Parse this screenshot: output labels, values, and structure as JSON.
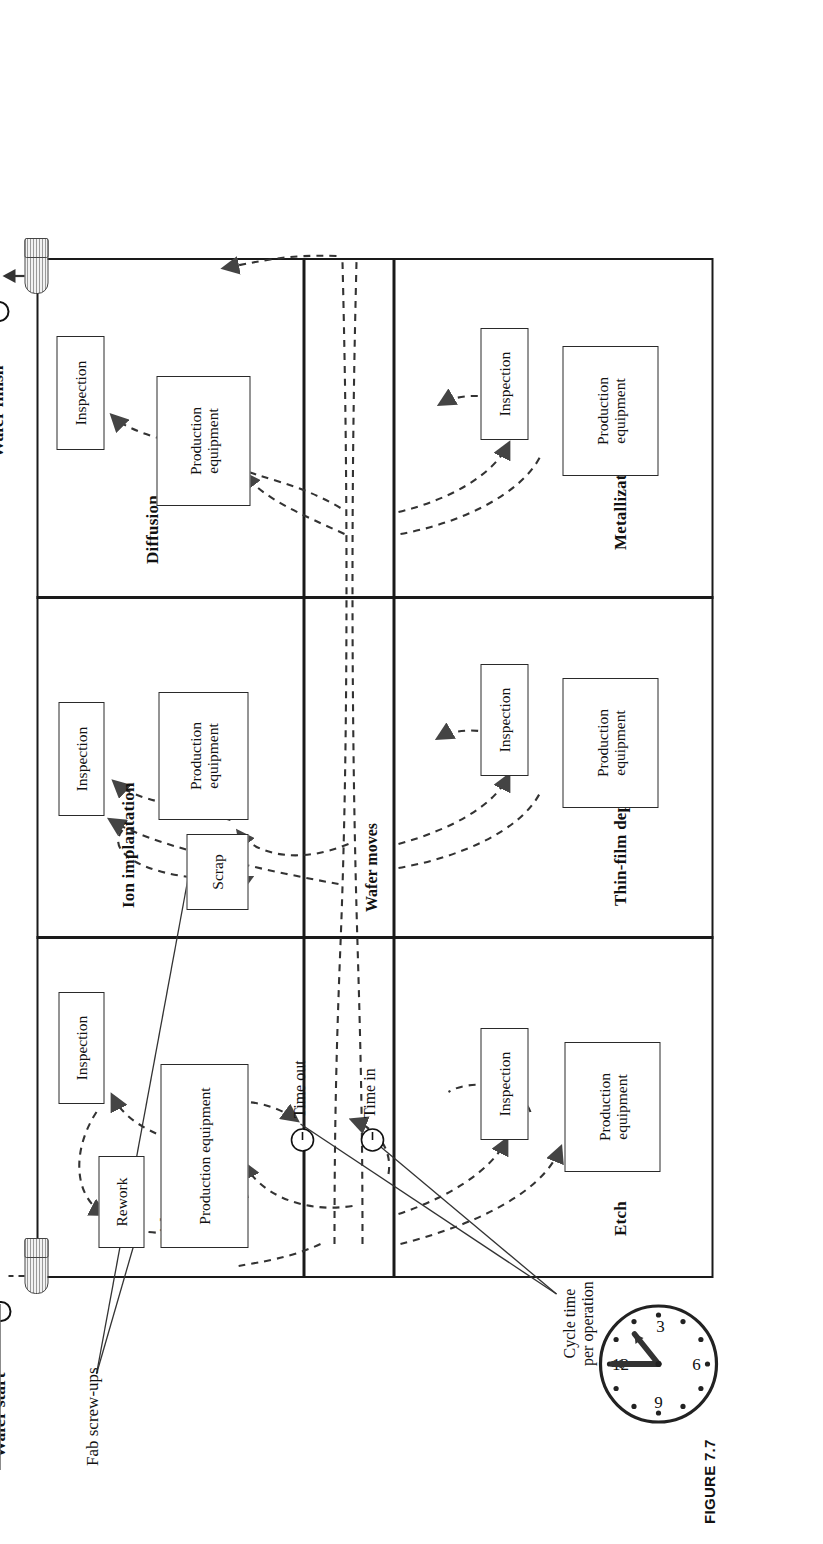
{
  "figure": {
    "caption": "FIGURE 7.7"
  },
  "endpoints": {
    "start_label": "Wafer start",
    "finish_label": "Wafer finish"
  },
  "corridor": {
    "wafer_moves_label": "Wafer moves"
  },
  "annotations": {
    "fab_screwups": "Fab screw-ups",
    "cycle_time": "Cycle time\nper operation",
    "cycle_time_line1": "Cycle time",
    "cycle_time_line2": "per operation",
    "time_in": "Time in",
    "time_out": "Time out"
  },
  "bays": [
    {
      "id": "lith",
      "label": "Lith",
      "boxes": [
        "Rework",
        "Inspection",
        "Production equipment"
      ]
    },
    {
      "id": "ion-implantation",
      "label": "Ion implantation",
      "boxes": [
        "Scrap",
        "Inspection",
        "Production equipment"
      ]
    },
    {
      "id": "diffusion",
      "label": "Diffusion",
      "boxes": [
        "Inspection",
        "Production equipment"
      ]
    },
    {
      "id": "etch",
      "label": "Etch",
      "boxes": [
        "Inspection",
        "Production equipment"
      ]
    },
    {
      "id": "thin-film-deposition",
      "label": "Thin-film deposition",
      "boxes": [
        "Inspection",
        "Production equipment"
      ]
    },
    {
      "id": "metallization",
      "label": "Metallization",
      "boxes": [
        "Inspection",
        "Production equipment"
      ]
    }
  ],
  "box_labels": {
    "inspection": "Inspection",
    "production_equipment_line1": "Production",
    "production_equipment_line2": "equipment",
    "production_equipment_inline": "Production equipment",
    "rework": "Rework",
    "scrap": "Scrap"
  },
  "calendars": {
    "start": {
      "name": "wafer-start-calendar",
      "highlighted_day": "1",
      "rows": [
        [
          "",
          "1",
          "2",
          "3",
          "4",
          "",
          ""
        ],
        [
          "",
          "6",
          "7",
          "8",
          "9",
          "10",
          "11"
        ],
        [
          "",
          "13",
          "14",
          "15",
          "16",
          "17",
          "18"
        ],
        [
          "",
          "20",
          "21",
          "22",
          "23",
          "24",
          "25"
        ],
        [
          "",
          "27",
          "28",
          "29",
          "30",
          "31",
          ""
        ]
      ]
    },
    "finish": {
      "name": "wafer-finish-calendar",
      "highlighted_day": "26",
      "rows": [
        [
          "",
          "",
          "",
          "",
          "",
          "",
          "1"
        ],
        [
          "2",
          "3",
          "4",
          "5",
          "6",
          "7",
          "8"
        ],
        [
          "9",
          "10",
          "11",
          "12",
          "13",
          "14",
          "15"
        ],
        [
          "16",
          "17",
          "18",
          "19",
          "20",
          "21",
          "22"
        ],
        [
          "23",
          "24",
          "25",
          "26",
          "27",
          "28",
          "29"
        ],
        [
          "30",
          "31",
          "",
          "",
          "",
          "",
          ""
        ]
      ]
    }
  },
  "clock": {
    "name": "cycle-time-clock",
    "numerals": [
      "12",
      "3",
      "6",
      "9"
    ]
  }
}
